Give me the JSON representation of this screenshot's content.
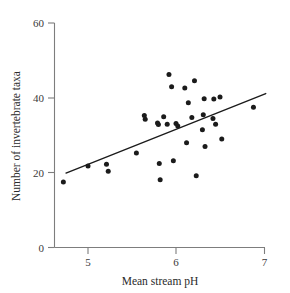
{
  "chart_data": {
    "type": "scatter",
    "title": "",
    "xlabel": "Mean stream pH",
    "ylabel": "Number of invertebrate taxa",
    "xlim": [
      4.6,
      7.05
    ],
    "ylim": [
      0,
      60
    ],
    "xticks": [
      5,
      6,
      7
    ],
    "xtick_labels": [
      "5",
      "6",
      "7"
    ],
    "yticks": [
      0,
      20,
      40,
      60
    ],
    "ytick_labels": [
      "0",
      "20",
      "40",
      "60"
    ],
    "grid": false,
    "legend": "none",
    "points": [
      {
        "x": 4.72,
        "y": 17.5
      },
      {
        "x": 5.0,
        "y": 21.8
      },
      {
        "x": 5.21,
        "y": 22.3
      },
      {
        "x": 5.23,
        "y": 20.4
      },
      {
        "x": 5.55,
        "y": 25.3
      },
      {
        "x": 5.64,
        "y": 35.3
      },
      {
        "x": 5.65,
        "y": 34.3
      },
      {
        "x": 5.79,
        "y": 33.3
      },
      {
        "x": 5.8,
        "y": 32.9
      },
      {
        "x": 5.81,
        "y": 22.5
      },
      {
        "x": 5.82,
        "y": 18.1
      },
      {
        "x": 5.86,
        "y": 35.0
      },
      {
        "x": 5.9,
        "y": 33.0
      },
      {
        "x": 5.92,
        "y": 46.3
      },
      {
        "x": 5.95,
        "y": 43.0
      },
      {
        "x": 5.97,
        "y": 23.2
      },
      {
        "x": 6.0,
        "y": 33.2
      },
      {
        "x": 6.02,
        "y": 32.5
      },
      {
        "x": 6.1,
        "y": 42.7
      },
      {
        "x": 6.12,
        "y": 28.0
      },
      {
        "x": 6.14,
        "y": 38.7
      },
      {
        "x": 6.18,
        "y": 34.8
      },
      {
        "x": 6.21,
        "y": 44.6
      },
      {
        "x": 6.23,
        "y": 19.2
      },
      {
        "x": 6.3,
        "y": 31.5
      },
      {
        "x": 6.31,
        "y": 35.5
      },
      {
        "x": 6.32,
        "y": 39.8
      },
      {
        "x": 6.33,
        "y": 27.0
      },
      {
        "x": 6.42,
        "y": 34.5
      },
      {
        "x": 6.43,
        "y": 39.7
      },
      {
        "x": 6.45,
        "y": 33.0
      },
      {
        "x": 6.5,
        "y": 40.3
      },
      {
        "x": 6.52,
        "y": 29.0
      },
      {
        "x": 6.88,
        "y": 37.5
      }
    ],
    "trendline": {
      "x_start": 4.75,
      "y_start": 19.9,
      "x_end": 7.02,
      "y_end": 41.2
    }
  }
}
